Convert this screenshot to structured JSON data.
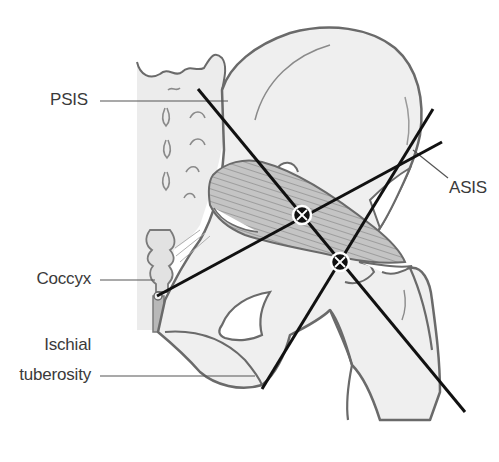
{
  "figure": {
    "type": "anatomical-diagram",
    "colors": {
      "background": "#ffffff",
      "bone_fill": "#efefef",
      "bone_outline": "#6a6a6a",
      "sacrum_fill": "#e6e6e6",
      "muscle_fill": "#bdbdbd",
      "muscle_stripes": "#8a8a8a",
      "reference_line": "#111111",
      "leader_line": "#555555",
      "label_text": "#3a3a3a"
    }
  },
  "labels": {
    "psis": "PSIS",
    "asis": "ASIS",
    "coccyx": "Coccyx",
    "ischial_line1": "Ischial",
    "ischial_line2": "tuberosity"
  },
  "reference_lines": [
    {
      "name": "psis-to-greater-trochanter",
      "from": [
        198,
        89
      ],
      "to": [
        465,
        412
      ]
    },
    {
      "name": "coccyx-to-asis",
      "from": [
        157,
        296
      ],
      "to": [
        442,
        142
      ]
    },
    {
      "name": "ischial-tuberosity-to-asis",
      "from": [
        262,
        389
      ],
      "to": [
        433,
        109
      ]
    }
  ],
  "intersection_markers": [
    {
      "name": "upper-intersection",
      "x": 302,
      "y": 215,
      "symbol": "⊗"
    },
    {
      "name": "lower-intersection",
      "x": 340,
      "y": 262,
      "symbol": "⊗"
    }
  ]
}
